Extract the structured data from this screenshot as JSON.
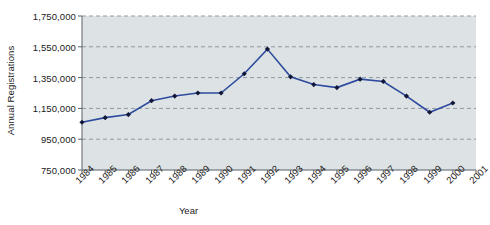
{
  "chart_data": {
    "type": "line",
    "title": "",
    "xlabel": "Year",
    "ylabel": "Annual Registrations",
    "x": [
      1984,
      1985,
      1986,
      1987,
      1988,
      1989,
      1990,
      1991,
      1992,
      1993,
      1994,
      1995,
      1996,
      1997,
      1998,
      1999,
      2000
    ],
    "values": [
      1060000,
      1090000,
      1110000,
      1200000,
      1230000,
      1250000,
      1250000,
      1375000,
      1535000,
      1355000,
      1305000,
      1285000,
      1340000,
      1325000,
      1230000,
      1125000,
      1185000
    ],
    "xtick_labels": [
      "1984",
      "1985",
      "1986",
      "1987",
      "1988",
      "1989",
      "1990",
      "1991",
      "1992",
      "1993",
      "1994",
      "1995",
      "1996",
      "1997",
      "1998",
      "1999",
      "2000",
      "2001"
    ],
    "xtick_values": [
      1984,
      1985,
      1986,
      1987,
      1988,
      1989,
      1990,
      1991,
      1992,
      1993,
      1994,
      1995,
      1996,
      1997,
      1998,
      1999,
      2000,
      2001
    ],
    "ytick_labels": [
      "1,750,000",
      "1,550,000",
      "1,350,000",
      "1,150,000",
      "950,000",
      "750,000"
    ],
    "ytick_values": [
      1750000,
      1550000,
      1350000,
      1150000,
      950000,
      750000
    ],
    "xlim": [
      1984,
      2001
    ],
    "ylim": [
      750000,
      1750000
    ],
    "grid": true,
    "grid_style": "dashed-horizontal",
    "legend": "none",
    "series_color": "#2e4a9e",
    "marker": "diamond",
    "marker_color": "#10173a",
    "plot_background": "#dde3e4",
    "axis_color": "#58606a",
    "grid_color": "#8f9aa0"
  }
}
